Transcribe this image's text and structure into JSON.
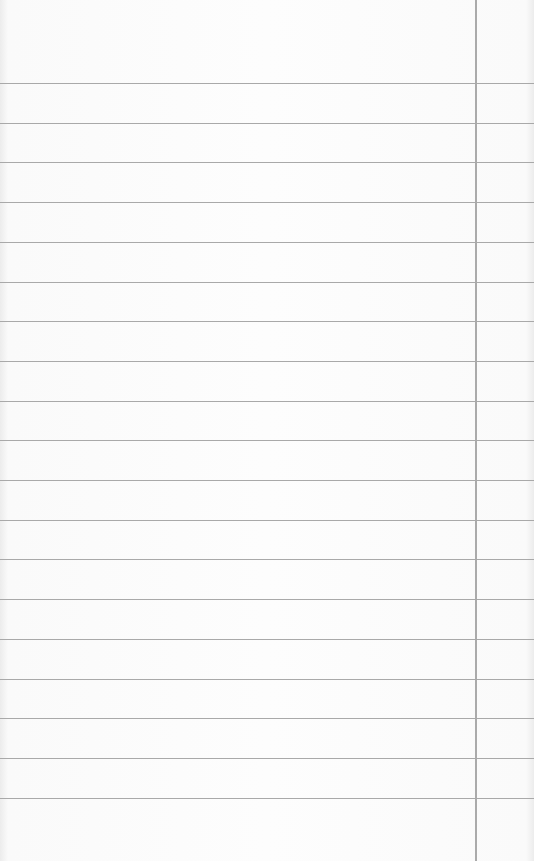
{
  "paper": {
    "type": "lined-paper",
    "background_color": "#fcfcfc",
    "rule_color": "#a9a9a9",
    "margin_line_color": "#aaaaaa",
    "margin_line_x": 475,
    "first_rule_y": 83,
    "rule_spacing": 39.7,
    "rule_count": 19
  }
}
